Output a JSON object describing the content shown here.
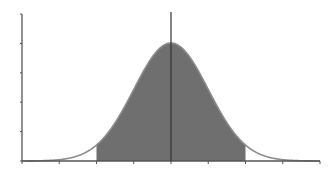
{
  "chart_data": {
    "type": "area",
    "title": "",
    "xlabel": "",
    "ylabel": "",
    "distribution": {
      "mean": 0,
      "std": 1
    },
    "x_ticks": [
      -4,
      -3,
      -2,
      -1,
      0,
      1,
      2,
      3,
      4
    ],
    "y_ticks": [
      0,
      0.1,
      0.2,
      0.3,
      0.4,
      0.5
    ],
    "xlim": [
      -4,
      4
    ],
    "ylim": [
      0,
      0.5
    ],
    "shaded_region": {
      "from": -2,
      "to": 2
    },
    "mean_line": {
      "x": 0
    },
    "tick_labels_visible": false,
    "grid": false,
    "legend": null,
    "colors": {
      "fill": "#6f6f6f",
      "curve": "#8c8c8c",
      "axis": "#555555",
      "mean_line": "#333333"
    }
  }
}
